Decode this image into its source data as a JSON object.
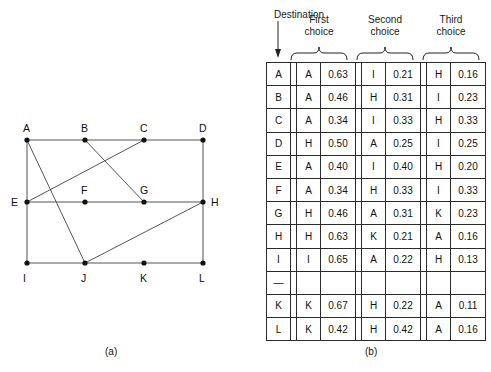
{
  "figure": {
    "caption_a": "(a)",
    "caption_b": "(b)"
  },
  "graph": {
    "nodes": [
      {
        "id": "A",
        "x": 27,
        "y": 140,
        "label_dx": -4,
        "label_dy": -17
      },
      {
        "id": "B",
        "x": 85,
        "y": 140,
        "label_dx": -4,
        "label_dy": -17
      },
      {
        "id": "C",
        "x": 144,
        "y": 140,
        "label_dx": -4,
        "label_dy": -17
      },
      {
        "id": "D",
        "x": 203,
        "y": 140,
        "label_dx": -4,
        "label_dy": -17
      },
      {
        "id": "E",
        "x": 27,
        "y": 202,
        "label_dx": -16,
        "label_dy": -5
      },
      {
        "id": "F",
        "x": 85,
        "y": 202,
        "label_dx": -4,
        "label_dy": -17
      },
      {
        "id": "G",
        "x": 144,
        "y": 202,
        "label_dx": -4,
        "label_dy": -17
      },
      {
        "id": "H",
        "x": 203,
        "y": 202,
        "label_dx": 8,
        "label_dy": -5
      },
      {
        "id": "I",
        "x": 27,
        "y": 263,
        "label_dx": -4,
        "label_dy": 10
      },
      {
        "id": "J",
        "x": 85,
        "y": 263,
        "label_dx": -4,
        "label_dy": 10
      },
      {
        "id": "K",
        "x": 144,
        "y": 263,
        "label_dx": -4,
        "label_dy": 10
      },
      {
        "id": "L",
        "x": 203,
        "y": 263,
        "label_dx": -4,
        "label_dy": 10
      }
    ],
    "edges": [
      [
        "A",
        "B"
      ],
      [
        "B",
        "C"
      ],
      [
        "C",
        "D"
      ],
      [
        "E",
        "F"
      ],
      [
        "F",
        "G"
      ],
      [
        "G",
        "H"
      ],
      [
        "I",
        "J"
      ],
      [
        "J",
        "K"
      ],
      [
        "K",
        "L"
      ],
      [
        "A",
        "E"
      ],
      [
        "E",
        "I"
      ],
      [
        "D",
        "H"
      ],
      [
        "H",
        "L"
      ],
      [
        "A",
        "J"
      ],
      [
        "E",
        "C"
      ],
      [
        "B",
        "G"
      ],
      [
        "J",
        "H"
      ]
    ],
    "edge_color": "#555555",
    "node_color": "#111111"
  },
  "table": {
    "destination_label": "Destination",
    "group_headers": [
      {
        "line1": "First",
        "line2": "choice"
      },
      {
        "line1": "Second",
        "line2": "choice"
      },
      {
        "line1": "Third",
        "line2": "choice"
      }
    ],
    "rows": [
      {
        "dest": "A",
        "first": {
          "node": "A",
          "prob": "0.63"
        },
        "second": {
          "node": "I",
          "prob": "0.21"
        },
        "third": {
          "node": "H",
          "prob": "0.16"
        }
      },
      {
        "dest": "B",
        "first": {
          "node": "A",
          "prob": "0.46"
        },
        "second": {
          "node": "H",
          "prob": "0.31"
        },
        "third": {
          "node": "I",
          "prob": "0.23"
        }
      },
      {
        "dest": "C",
        "first": {
          "node": "A",
          "prob": "0.34"
        },
        "second": {
          "node": "I",
          "prob": "0.33"
        },
        "third": {
          "node": "H",
          "prob": "0.33"
        }
      },
      {
        "dest": "D",
        "first": {
          "node": "H",
          "prob": "0.50"
        },
        "second": {
          "node": "A",
          "prob": "0.25"
        },
        "third": {
          "node": "I",
          "prob": "0.25"
        }
      },
      {
        "dest": "E",
        "first": {
          "node": "A",
          "prob": "0.40"
        },
        "second": {
          "node": "I",
          "prob": "0.40"
        },
        "third": {
          "node": "H",
          "prob": "0.20"
        }
      },
      {
        "dest": "F",
        "first": {
          "node": "A",
          "prob": "0.34"
        },
        "second": {
          "node": "H",
          "prob": "0.33"
        },
        "third": {
          "node": "I",
          "prob": "0.33"
        }
      },
      {
        "dest": "G",
        "first": {
          "node": "H",
          "prob": "0.46"
        },
        "second": {
          "node": "A",
          "prob": "0.31"
        },
        "third": {
          "node": "K",
          "prob": "0.23"
        }
      },
      {
        "dest": "H",
        "first": {
          "node": "H",
          "prob": "0.63"
        },
        "second": {
          "node": "K",
          "prob": "0.21"
        },
        "third": {
          "node": "A",
          "prob": "0.16"
        }
      },
      {
        "dest": "I",
        "first": {
          "node": "I",
          "prob": "0.65"
        },
        "second": {
          "node": "A",
          "prob": "0.22"
        },
        "third": {
          "node": "H",
          "prob": "0.13"
        }
      },
      {
        "dest": "—",
        "first": {
          "node": "",
          "prob": ""
        },
        "second": {
          "node": "",
          "prob": ""
        },
        "third": {
          "node": "",
          "prob": ""
        }
      },
      {
        "dest": "K",
        "first": {
          "node": "K",
          "prob": "0.67"
        },
        "second": {
          "node": "H",
          "prob": "0.22"
        },
        "third": {
          "node": "A",
          "prob": "0.11"
        }
      },
      {
        "dest": "L",
        "first": {
          "node": "K",
          "prob": "0.42"
        },
        "second": {
          "node": "H",
          "prob": "0.42"
        },
        "third": {
          "node": "A",
          "prob": "0.16"
        }
      }
    ]
  }
}
